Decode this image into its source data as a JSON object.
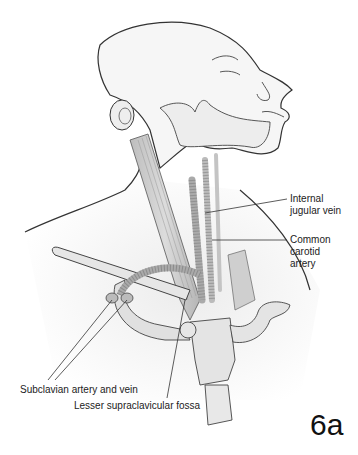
{
  "figure": {
    "number": "6a",
    "labels": {
      "internal_jugular_vein": [
        "Internal",
        "jugular vein"
      ],
      "common_carotid_artery": [
        "Common",
        "carotid",
        "artery"
      ],
      "subclavian": "Subclavian artery and vein",
      "lesser_fossa": "Lesser supraclavicular fossa"
    }
  },
  "colors": {
    "outline": "#333333",
    "skin": "#f4f4f4",
    "muscle": "#c8c8c8",
    "vessel": "#b0b0b0",
    "bone": "#e2e2e2"
  }
}
